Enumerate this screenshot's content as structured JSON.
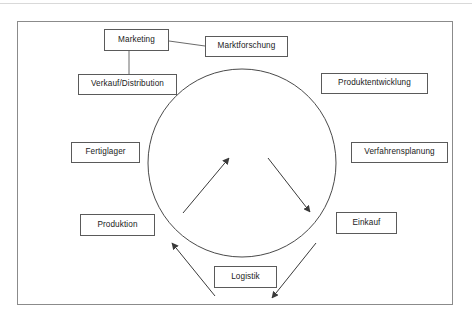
{
  "diagram": {
    "frame": {
      "x": 17,
      "y": 21,
      "width": 436,
      "height": 284
    },
    "circle": {
      "cx": 242,
      "cy": 163,
      "r": 94,
      "stroke": "#4a4a4a"
    },
    "colors": {
      "frame_border": "#8b8b8b",
      "node_border": "#5a5a5a",
      "node_fill": "#ffffff",
      "line": "#6b6b6b",
      "arrow": "#3a3a3a",
      "top_rule": "#d9d9d9",
      "text": "#1a1a1a"
    },
    "nodes": [
      {
        "id": "marketing",
        "label": "Marketing",
        "x": 104,
        "y": 29,
        "width": 65,
        "height": 22
      },
      {
        "id": "marktforschung",
        "label": "Marktforschung",
        "x": 205,
        "y": 36,
        "width": 83,
        "height": 21
      },
      {
        "id": "verkauf-distribution",
        "label": "Verkauf/Distribution",
        "x": 78,
        "y": 74,
        "width": 99,
        "height": 21
      },
      {
        "id": "produktentwicklung",
        "label": "Produktentwicklung",
        "x": 321,
        "y": 73,
        "width": 107,
        "height": 21
      },
      {
        "id": "fertiglager",
        "label": "Fertiglager",
        "x": 71,
        "y": 142,
        "width": 69,
        "height": 21
      },
      {
        "id": "verfahrensplanung",
        "label": "Verfahrensplanung",
        "x": 351,
        "y": 142,
        "width": 97,
        "height": 21
      },
      {
        "id": "produktion",
        "label": "Produktion",
        "x": 80,
        "y": 214,
        "width": 75,
        "height": 22
      },
      {
        "id": "einkauf",
        "label": "Einkauf",
        "x": 336,
        "y": 212,
        "width": 61,
        "height": 22
      },
      {
        "id": "logistik",
        "label": "Logistik",
        "x": 214,
        "y": 266,
        "width": 63,
        "height": 22
      }
    ],
    "connectors": [
      {
        "id": "marketing-to-marktforschung",
        "from": "marketing",
        "to": "marktforschung",
        "x1": 169,
        "y1": 41,
        "x2": 205,
        "y2": 46
      },
      {
        "id": "marketing-to-verkauf",
        "from": "marketing",
        "to": "verkauf-distribution",
        "x1": 129,
        "y1": 51,
        "x2": 129,
        "y2": 74
      }
    ],
    "arrows": [
      {
        "id": "arrow-bottom-left-to-top-right",
        "direction": "up-right",
        "x1": 183,
        "y1": 213,
        "x2": 229,
        "y2": 158
      },
      {
        "id": "arrow-top-right-to-bottom-right",
        "direction": "down-right",
        "x1": 268,
        "y1": 158,
        "x2": 310,
        "y2": 212
      },
      {
        "id": "arrow-bottom-right-to-lower",
        "direction": "down-left",
        "x1": 316,
        "y1": 243,
        "x2": 272,
        "y2": 298
      },
      {
        "id": "arrow-lower-to-left",
        "direction": "up-left",
        "x1": 215,
        "y1": 296,
        "x2": 172,
        "y2": 243
      }
    ]
  }
}
